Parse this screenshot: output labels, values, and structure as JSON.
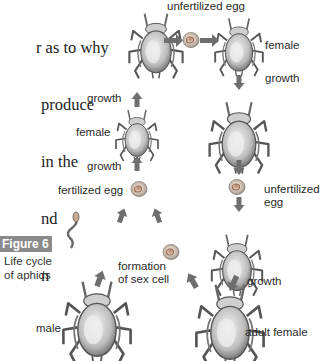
{
  "paragraph": {
    "lines": [
      "r as to why",
      "produce",
      "in the",
      "nd",
      "n"
    ]
  },
  "figure": {
    "badge": "Figure 6",
    "caption_line1": "Life cycle",
    "caption_line2": "of aphids"
  },
  "labels": {
    "unfertilized_egg_top": "unfertilized egg",
    "female_right": "female",
    "growth_right_top": "growth",
    "growth_left_top": "growth",
    "female_left": "female",
    "growth_left_mid": "growth",
    "fertilized_egg": "fertilized egg",
    "unfertilized_egg_right_1": "unfertilized",
    "unfertilized_egg_right_2": "egg",
    "formation_1": "formation",
    "formation_2": "of sex cell",
    "growth_right_bottom": "growth",
    "male": "male",
    "adult_female": "adult female"
  },
  "colors": {
    "arrow": "#6e6e6e",
    "egg": "#c9b8a4",
    "aphid_body": "#d8d8d8",
    "aphid_outline": "#555555",
    "badge_bg": "#8a8a8a"
  }
}
